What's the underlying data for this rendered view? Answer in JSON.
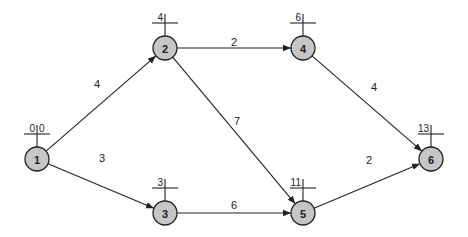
{
  "diagram": {
    "type": "activity-network",
    "nodes": [
      {
        "id": "1",
        "label": "1",
        "x": 37,
        "y": 159,
        "early": "0",
        "late": "0"
      },
      {
        "id": "2",
        "label": "2",
        "x": 165,
        "y": 48,
        "early": "4",
        "late": ""
      },
      {
        "id": "3",
        "label": "3",
        "x": 165,
        "y": 213,
        "early": "3",
        "late": ""
      },
      {
        "id": "4",
        "label": "4",
        "x": 303,
        "y": 48,
        "early": "6",
        "late": ""
      },
      {
        "id": "5",
        "label": "5",
        "x": 303,
        "y": 213,
        "early": "11",
        "late": ""
      },
      {
        "id": "6",
        "label": "6",
        "x": 431,
        "y": 159,
        "early": "13",
        "late": ""
      }
    ],
    "edges": [
      {
        "from": "1",
        "to": "2",
        "weight": "4",
        "lx": 97,
        "ly": 84
      },
      {
        "from": "1",
        "to": "3",
        "weight": "3",
        "lx": 102,
        "ly": 158
      },
      {
        "from": "2",
        "to": "4",
        "weight": "2",
        "lx": 234,
        "ly": 42
      },
      {
        "from": "2",
        "to": "5",
        "weight": "7",
        "lx": 237,
        "ly": 121
      },
      {
        "from": "3",
        "to": "5",
        "weight": "6",
        "lx": 234,
        "ly": 205
      },
      {
        "from": "4",
        "to": "6",
        "weight": "4",
        "lx": 374,
        "ly": 87
      },
      {
        "from": "5",
        "to": "6",
        "weight": "2",
        "lx": 369,
        "ly": 160
      }
    ]
  }
}
